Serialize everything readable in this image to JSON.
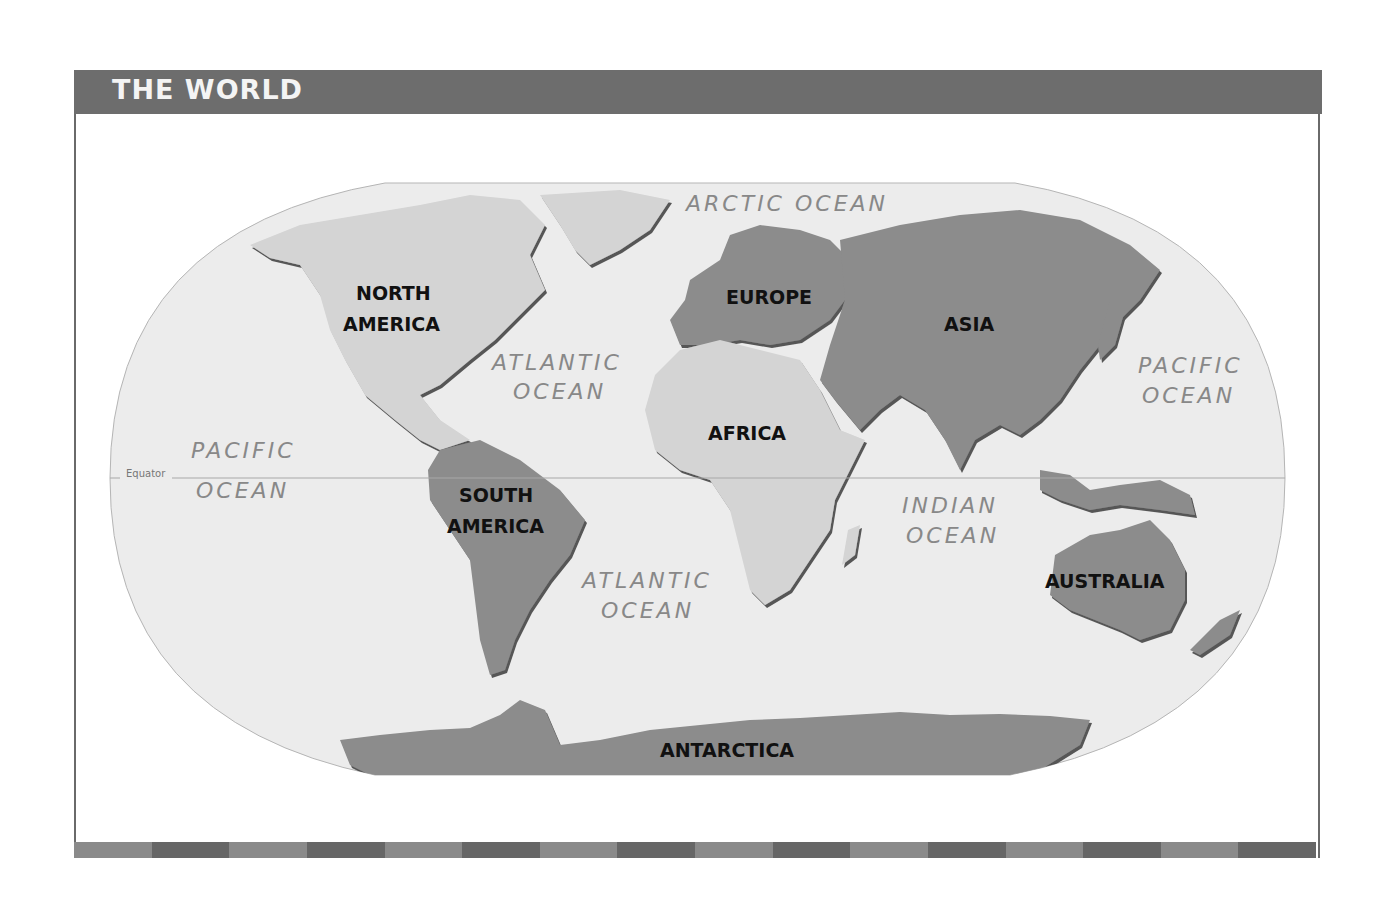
{
  "header": {
    "title": "THE WORLD"
  },
  "colors": {
    "title_bar": "#6d6d6d",
    "ocean": "#ebebeb",
    "land_light": "#d2d2d2",
    "land_dark": "#8c8c8c",
    "bar_light": "#8a8a8a",
    "bar_dark": "#666666"
  },
  "map": {
    "continents": [
      {
        "id": "north-america",
        "lines": [
          "NORTH",
          "AMERICA"
        ]
      },
      {
        "id": "south-america",
        "lines": [
          "SOUTH",
          "AMERICA"
        ]
      },
      {
        "id": "europe",
        "lines": [
          "EUROPE"
        ]
      },
      {
        "id": "africa",
        "lines": [
          "AFRICA"
        ]
      },
      {
        "id": "asia",
        "lines": [
          "ASIA"
        ]
      },
      {
        "id": "australia",
        "lines": [
          "AUSTRALIA"
        ]
      },
      {
        "id": "antarctica",
        "lines": [
          "ANTARCTICA"
        ]
      }
    ],
    "oceans": [
      {
        "id": "arctic-ocean",
        "lines": [
          "ARCTIC OCEAN"
        ]
      },
      {
        "id": "atlantic-ocean-north",
        "lines": [
          "ATLANTIC",
          "OCEAN"
        ]
      },
      {
        "id": "atlantic-ocean-south",
        "lines": [
          "ATLANTIC",
          "OCEAN"
        ]
      },
      {
        "id": "pacific-ocean-west",
        "lines": [
          "PACIFIC",
          "OCEAN"
        ]
      },
      {
        "id": "pacific-ocean-east",
        "lines": [
          "PACIFIC",
          "OCEAN"
        ]
      },
      {
        "id": "indian-ocean",
        "lines": [
          "INDIAN",
          "OCEAN"
        ]
      }
    ],
    "equator_label": "Equator"
  },
  "footer": {
    "stripe_segments": 16
  }
}
